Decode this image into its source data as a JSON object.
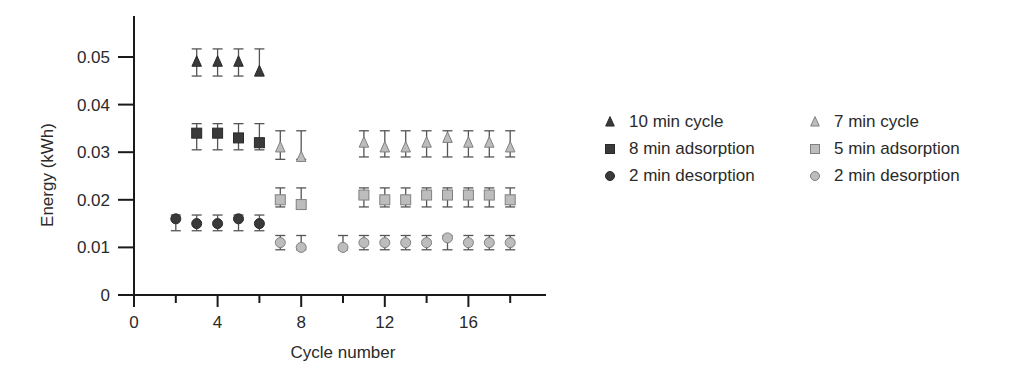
{
  "chart_data": {
    "type": "scatter",
    "title": "",
    "xlabel": "Cycle number",
    "ylabel": "Energy (kWh)",
    "xlim": [
      0,
      19.5
    ],
    "ylim": [
      0,
      0.056
    ],
    "xticks": [
      0,
      4,
      8,
      12,
      16
    ],
    "xticks_minor": [
      2,
      6,
      10,
      14,
      18
    ],
    "yticks": [
      0,
      0.01,
      0.02,
      0.03,
      0.04,
      0.05
    ],
    "ytick_labels": [
      "0",
      "0.01",
      "0.02",
      "0.03",
      "0.04",
      "0.05"
    ],
    "grid": false,
    "legend_position": "right",
    "series": [
      {
        "name": "10 min cycle",
        "marker": "triangle",
        "color": "#3a3a3a",
        "x": [
          3,
          4,
          5,
          6
        ],
        "y": [
          0.049,
          0.049,
          0.049,
          0.047
        ],
        "err_low": [
          0.046,
          0.046,
          0.046,
          0.046
        ],
        "err_high": [
          0.0517,
          0.0517,
          0.0517,
          0.0517
        ]
      },
      {
        "name": "8 min adsorption",
        "marker": "square",
        "color": "#3a3a3a",
        "x": [
          3,
          4,
          5,
          6
        ],
        "y": [
          0.034,
          0.034,
          0.033,
          0.032
        ],
        "err_low": [
          0.0305,
          0.0305,
          0.0305,
          0.0305
        ],
        "err_high": [
          0.036,
          0.036,
          0.036,
          0.036
        ]
      },
      {
        "name": "2 min desorption",
        "marker": "circle",
        "color": "#3a3a3a",
        "x": [
          2,
          3,
          4,
          5,
          6
        ],
        "y": [
          0.016,
          0.015,
          0.015,
          0.016,
          0.015
        ],
        "err_low": [
          0.0135,
          0.0135,
          0.0135,
          0.0135,
          0.0135
        ],
        "err_high": [
          0.0168,
          0.0168,
          0.0168,
          0.0168,
          0.0168
        ]
      },
      {
        "name": "7 min cycle",
        "marker": "triangle",
        "color": "#bdbdbd",
        "x": [
          7,
          8,
          11,
          12,
          13,
          14,
          15,
          16,
          17,
          18
        ],
        "y": [
          0.031,
          0.029,
          0.032,
          0.031,
          0.031,
          0.032,
          0.033,
          0.032,
          0.032,
          0.031
        ],
        "err_low": [
          0.0285,
          0.0285,
          0.029,
          0.029,
          0.029,
          0.029,
          0.029,
          0.029,
          0.029,
          0.029
        ],
        "err_high": [
          0.0345,
          0.0345,
          0.0345,
          0.0345,
          0.0345,
          0.0345,
          0.0345,
          0.0345,
          0.0345,
          0.0345
        ]
      },
      {
        "name": "5 min adsorption",
        "marker": "square",
        "color": "#bdbdbd",
        "x": [
          7,
          8,
          11,
          12,
          13,
          14,
          15,
          16,
          17,
          18
        ],
        "y": [
          0.02,
          0.019,
          0.021,
          0.02,
          0.02,
          0.021,
          0.021,
          0.021,
          0.021,
          0.02
        ],
        "err_low": [
          0.0185,
          0.0185,
          0.0185,
          0.0185,
          0.0185,
          0.0185,
          0.0185,
          0.0185,
          0.0185,
          0.0185
        ],
        "err_high": [
          0.0225,
          0.0225,
          0.0225,
          0.0225,
          0.0225,
          0.0225,
          0.0225,
          0.0225,
          0.0225,
          0.0225
        ]
      },
      {
        "name": "2 min desorption",
        "marker": "circle",
        "color": "#bdbdbd",
        "x": [
          7,
          8,
          10,
          11,
          12,
          13,
          14,
          15,
          16,
          17,
          18
        ],
        "y": [
          0.011,
          0.01,
          0.01,
          0.011,
          0.011,
          0.011,
          0.011,
          0.012,
          0.011,
          0.011,
          0.011
        ],
        "err_low": [
          0.0095,
          0.0095,
          0.0095,
          0.0095,
          0.0095,
          0.0095,
          0.0095,
          0.0095,
          0.0095,
          0.0095,
          0.0095
        ],
        "err_high": [
          0.0125,
          0.0125,
          0.0125,
          0.0125,
          0.0125,
          0.0125,
          0.0125,
          0.0125,
          0.0125,
          0.0125,
          0.0125
        ]
      }
    ]
  },
  "legend": {
    "items": [
      {
        "label": "10 min cycle",
        "marker": "triangle",
        "color": "#3a3a3a"
      },
      {
        "label": "7 min cycle",
        "marker": "triangle",
        "color": "#bdbdbd"
      },
      {
        "label": "8 min adsorption",
        "marker": "square",
        "color": "#3a3a3a"
      },
      {
        "label": "5 min adsorption",
        "marker": "square",
        "color": "#bdbdbd"
      },
      {
        "label": "2 min desorption",
        "marker": "circle",
        "color": "#3a3a3a"
      },
      {
        "label": "2 min desorption",
        "marker": "circle",
        "color": "#bdbdbd"
      }
    ]
  },
  "style": {
    "axis_color": "#1a1a1a",
    "errorbar_color": "#555555",
    "light_outline": "#808080"
  }
}
